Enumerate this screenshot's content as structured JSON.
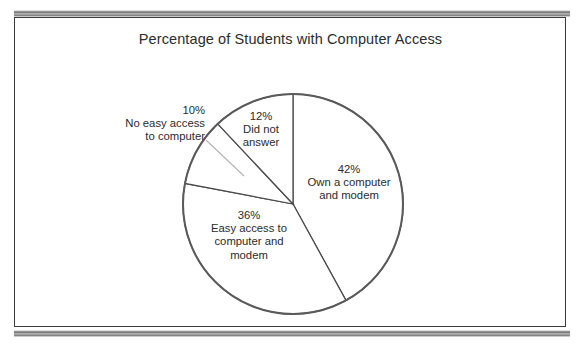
{
  "chart_data": {
    "type": "pie",
    "title": "Percentage of Students with Computer Access",
    "xlabel": "",
    "ylabel": "",
    "legend_position": "none",
    "grid": false,
    "start_angle_deg": 0,
    "direction": "clockwise",
    "center": {
      "x": 293,
      "y": 204
    },
    "radius": 110,
    "categories": [
      "Own a computer and modem",
      "Easy access to computer and modem",
      "No easy access to computer",
      "Did not answer"
    ],
    "values": [
      42,
      36,
      10,
      12
    ],
    "slices": [
      {
        "id": "own",
        "percent_label": "42%",
        "value": 42,
        "line1": "Own a computer",
        "line2": "and modem",
        "label_placement": "inside",
        "fill": "#ffffff",
        "stroke": "#4a4a4a"
      },
      {
        "id": "easy",
        "percent_label": "36%",
        "value": 36,
        "line1": "Easy access to",
        "line2": "computer and",
        "line3": "modem",
        "label_placement": "inside",
        "fill": "#ffffff",
        "stroke": "#4a4a4a"
      },
      {
        "id": "noeasy",
        "percent_label": "10%",
        "value": 10,
        "line1": "No easy access",
        "line2": "to computer",
        "label_placement": "outside-left",
        "has_leader_line": true,
        "fill": "#ffffff",
        "stroke": "#4a4a4a"
      },
      {
        "id": "didnot",
        "percent_label": "12%",
        "value": 12,
        "line1": "Did not",
        "line2": "answer",
        "label_placement": "inside",
        "fill": "#ffffff",
        "stroke": "#4a4a4a"
      }
    ],
    "colors": {
      "slice_fill": "#ffffff",
      "slice_outline": "#4a4a4a",
      "circle_outline": "#5a5a5a",
      "leader_line": "#b0b0b0",
      "text": "#2b2b2b",
      "frame": "#3a3a3a",
      "band": "#7a7a7a",
      "background": "#ffffff"
    }
  }
}
